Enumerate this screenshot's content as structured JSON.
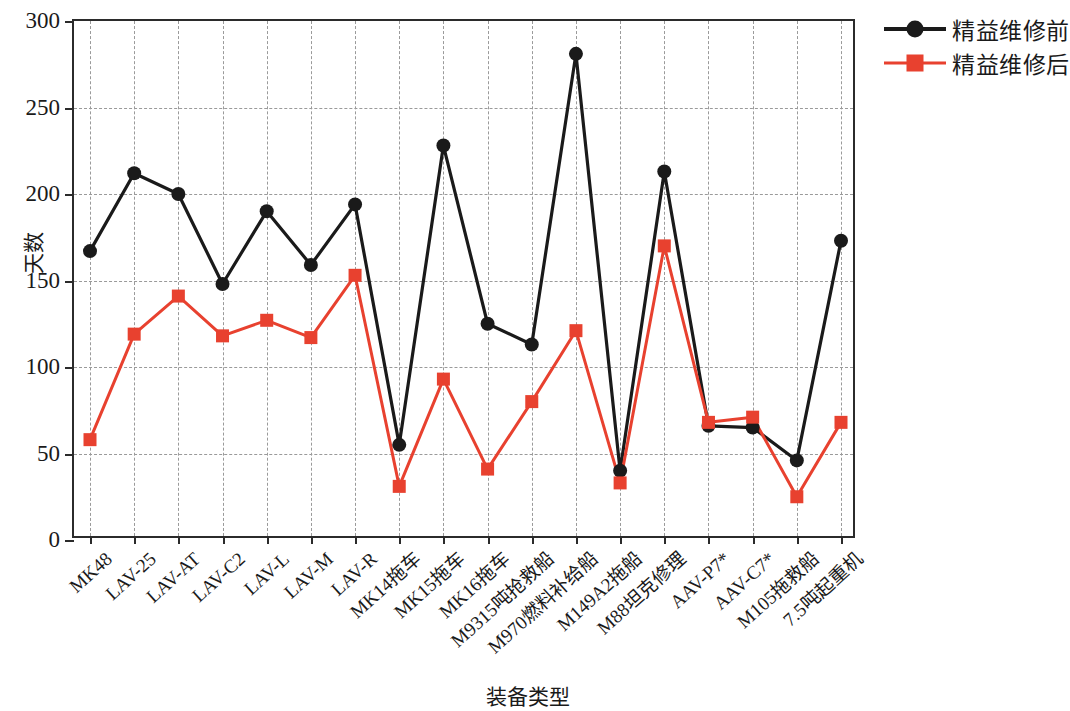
{
  "axes": {
    "y_title": "天数",
    "x_title": "装备类型",
    "y_ticks": [
      0,
      50,
      100,
      150,
      200,
      250,
      300
    ]
  },
  "legend": {
    "position": "upper-right",
    "items": [
      {
        "label": "精益维修前",
        "color": "#1a1a1a",
        "marker": "circle",
        "name": "legend-before"
      },
      {
        "label": "精益维修后",
        "color": "#e8412f",
        "marker": "square",
        "name": "legend-after"
      }
    ]
  },
  "colors": {
    "before": "#1a1a1a",
    "after": "#e8412f",
    "grid": "#9a9a9a",
    "frame": "#2b2b2b"
  },
  "chart_data": {
    "type": "line",
    "title": "",
    "xlabel": "装备类型",
    "ylabel": "天数",
    "ylim": [
      0,
      300
    ],
    "yticks": [
      0,
      50,
      100,
      150,
      200,
      250,
      300
    ],
    "grid": true,
    "legend_position": "upper right",
    "categories": [
      "MK48",
      "LAV-25",
      "LAV-AT",
      "LAV-C2",
      "LAV-L",
      "LAV-M",
      "LAV-R",
      "MK14拖车",
      "MK15拖车",
      "MK16拖车",
      "M9315吨抢救船",
      "M970燃料补给船",
      "M149A2拖船",
      "M88坦克修理",
      "AAV-P7*",
      "AAV-C7*",
      "M105拖救船",
      "7.5吨起重机"
    ],
    "series": [
      {
        "name": "精益维修前",
        "color": "#1a1a1a",
        "marker": "circle",
        "values": [
          167,
          212,
          200,
          148,
          190,
          159,
          194,
          55,
          228,
          125,
          113,
          281,
          40,
          213,
          66,
          65,
          46,
          173
        ]
      },
      {
        "name": "精益维修后",
        "color": "#e8412f",
        "marker": "square",
        "values": [
          58,
          119,
          141,
          118,
          127,
          117,
          153,
          31,
          93,
          41,
          80,
          121,
          33,
          170,
          68,
          71,
          25,
          68
        ]
      }
    ]
  }
}
